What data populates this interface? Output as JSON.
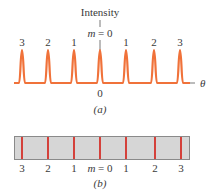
{
  "figure_a": {
    "axis_title": "Intensity",
    "center_label_var": "m",
    "center_label_eq": " = 0",
    "order_labels": [
      "3",
      "2",
      "1",
      "",
      "1",
      "2",
      "3"
    ],
    "zero_label": "0",
    "theta_label": "θ",
    "caption": "(a)",
    "peak_color": "#f0723a",
    "peak_x": [
      22,
      48,
      74,
      100,
      126,
      154,
      180
    ]
  },
  "figure_b": {
    "caption": "(b)",
    "order_labels": [
      "3",
      "2",
      "1",
      "",
      "1",
      "2",
      "3"
    ],
    "center_label_var": "m",
    "center_label_eq": " = 0",
    "bar_fill": "#d6d6d6",
    "bar_border": "#8a8a8a",
    "line_color": "#d4302a",
    "line_x": [
      22,
      48,
      74,
      100,
      126,
      155,
      181
    ]
  }
}
